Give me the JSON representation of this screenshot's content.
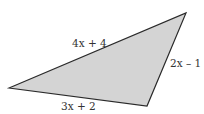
{
  "diagram": {
    "shape": "triangle",
    "fill_color": "#d4d4d4",
    "stroke_color": "#2a2a2a",
    "sides": [
      {
        "id": "top",
        "label": "4x + 4"
      },
      {
        "id": "right",
        "label": "2x – 1"
      },
      {
        "id": "bottom",
        "label": "3x + 2"
      }
    ]
  }
}
